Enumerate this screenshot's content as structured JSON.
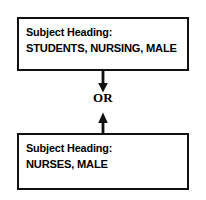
{
  "diagram": {
    "ink_color": "#000000",
    "background_color": "#ffffff",
    "nodes": [
      {
        "id": "top",
        "heading_label": "Subject Heading:",
        "term": "STUDENTS, NURSING, MALE"
      },
      {
        "id": "bottom",
        "heading_label": "Subject Heading:",
        "term": "NURSES, MALE"
      }
    ],
    "connector": {
      "label": "OR",
      "down_arrow": "arrow-down-icon",
      "up_arrow": "arrow-up-icon"
    }
  }
}
